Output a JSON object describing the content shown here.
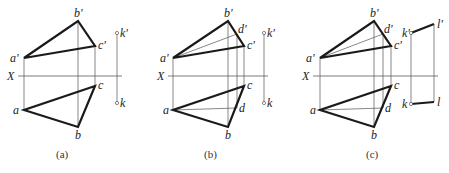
{
  "figure": {
    "axis_label": "X",
    "panels": [
      {
        "id": "a",
        "caption": "(a)",
        "labels": {
          "a1": "a'",
          "b1": "b'",
          "c1": "c'",
          "k1": "k'",
          "a": "a",
          "b": "b",
          "c": "c",
          "k": "k"
        }
      },
      {
        "id": "b",
        "caption": "(b)",
        "labels": {
          "a1": "a'",
          "b1": "b'",
          "c1": "c'",
          "d1": "d'",
          "k1": "k'",
          "a": "a",
          "b": "b",
          "c": "c",
          "d": "d",
          "k": "k"
        }
      },
      {
        "id": "c",
        "caption": "(c)",
        "labels": {
          "a1": "a'",
          "b1": "b'",
          "c1": "c'",
          "d1": "d'",
          "k1": "k'",
          "l1": "l'",
          "a": "a",
          "b": "b",
          "c": "c",
          "d": "d",
          "k": "k",
          "l": "l"
        }
      }
    ]
  }
}
